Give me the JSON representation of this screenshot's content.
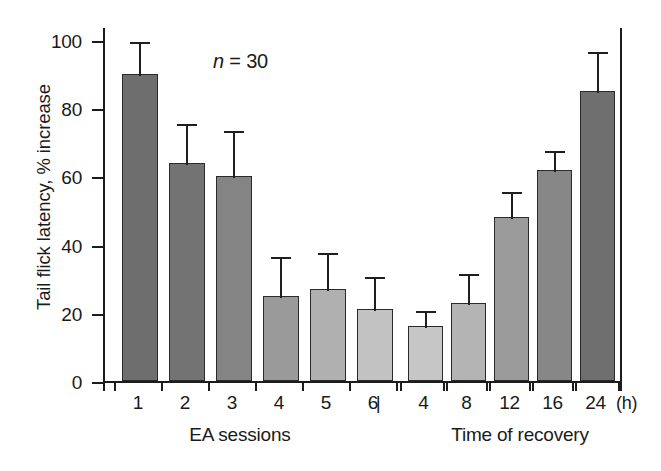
{
  "chart_data": {
    "type": "bar",
    "title": "",
    "xlabel": "",
    "ylabel": "Tail flick latency, % increase",
    "ylim": [
      0,
      100
    ],
    "yticks": [
      0,
      20,
      40,
      60,
      80,
      100
    ],
    "ytick_labels": [
      "0",
      "20",
      "40",
      "60",
      "80",
      "100"
    ],
    "grid": false,
    "legend": null,
    "annotations": [
      {
        "text_prefix": "n",
        "text_rest": " = 30",
        "full": "n = 30"
      }
    ],
    "group_labels": [
      "EA sessions",
      "Time of recovery"
    ],
    "unit_label": "(h)",
    "separator": "|",
    "categories": [
      "1",
      "2",
      "3",
      "4",
      "5",
      "6",
      "4",
      "8",
      "12",
      "16",
      "24"
    ],
    "series": [
      {
        "name": "Tail flick latency increase",
        "values": [
          90,
          64,
          60,
          25,
          27,
          21,
          16,
          23,
          48,
          62,
          85
        ],
        "errors": [
          10,
          12,
          14,
          12,
          11,
          10,
          5,
          9,
          8,
          6,
          12
        ]
      }
    ],
    "bars": [
      {
        "category": "1",
        "group": "EA sessions",
        "value": 90,
        "error": 10,
        "fill": "#6e6e6e"
      },
      {
        "category": "2",
        "group": "EA sessions",
        "value": 64,
        "error": 12,
        "fill": "#737373"
      },
      {
        "category": "3",
        "group": "EA sessions",
        "value": 60,
        "error": 14,
        "fill": "#848484"
      },
      {
        "category": "4",
        "group": "EA sessions",
        "value": 25,
        "error": 12,
        "fill": "#9a9a9a"
      },
      {
        "category": "5",
        "group": "EA sessions",
        "value": 27,
        "error": 11,
        "fill": "#b0b0b0"
      },
      {
        "category": "6",
        "group": "EA sessions",
        "value": 21,
        "error": 10,
        "fill": "#c2c2c2"
      },
      {
        "category": "4",
        "group": "Time of recovery",
        "value": 16,
        "error": 5,
        "fill": "#c6c6c6"
      },
      {
        "category": "8",
        "group": "Time of recovery",
        "value": 23,
        "error": 9,
        "fill": "#b4b4b4"
      },
      {
        "category": "12",
        "group": "Time of recovery",
        "value": 48,
        "error": 8,
        "fill": "#9b9b9b"
      },
      {
        "category": "16",
        "group": "Time of recovery",
        "value": 62,
        "error": 6,
        "fill": "#878787"
      },
      {
        "category": "24",
        "group": "Time of recovery",
        "value": 85,
        "error": 12,
        "fill": "#6f6f6f"
      }
    ]
  },
  "colors": {
    "axis": "#1c1c1c",
    "text": "#1a1a1a",
    "background": "#ffffff"
  }
}
